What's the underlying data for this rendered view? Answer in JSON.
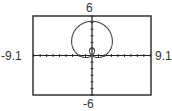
{
  "window": {
    "ymax_label": "6",
    "ymin_label": "-6",
    "xmin_label": "-9.1",
    "xmax_label": "9.1"
  },
  "colors": {
    "frame": "#333333",
    "axis": "#222222",
    "curve": "#444444",
    "background": "#ffffff"
  },
  "chart_data": {
    "type": "line",
    "title": "",
    "subtitle": "",
    "xlabel": "",
    "ylabel": "",
    "xlim": [
      -9.1,
      9.1
    ],
    "ylim": [
      -6,
      6
    ],
    "x_tick_spacing": 1,
    "y_tick_spacing": 1,
    "grid": false,
    "legend": null,
    "polar": {
      "a": 2,
      "b": 3.2,
      "function": "sin"
    },
    "key_points": {
      "outer_loop_top": [
        0,
        5.2
      ],
      "inner_loop_top": [
        0,
        1.2
      ],
      "outer_loop_max_half_width": 3.3,
      "pole": [
        0,
        0
      ]
    },
    "annotations": [
      "6",
      "-6",
      "-9.1",
      "9.1"
    ]
  },
  "frame": {
    "left": 33,
    "top": 16,
    "right": 151,
    "bottom": 95
  }
}
